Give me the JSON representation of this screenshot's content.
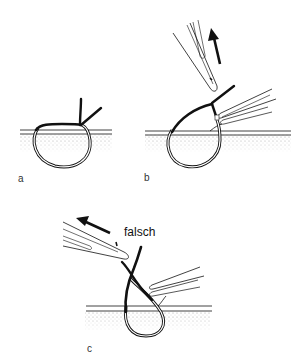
{
  "figure": {
    "panels": [
      {
        "id": "a",
        "label": "a",
        "description": "tied suture loop through tissue with knot on top and two cut ends"
      },
      {
        "id": "b",
        "label": "b",
        "description": "forceps pulling suture end upward while second forceps holds tissue edge",
        "arrow_direction": "up"
      },
      {
        "id": "c",
        "label": "c",
        "description": "forceps pulling suture sideways — incorrect technique",
        "annotation": "falsch",
        "arrow_direction": "left"
      }
    ],
    "colors": {
      "line": "#111111",
      "tissue_stipple": "#9a9a9a",
      "background": "#ffffff"
    }
  }
}
